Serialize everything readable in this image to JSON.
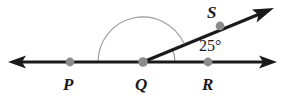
{
  "figure": {
    "labels": {
      "p": "P",
      "q": "Q",
      "r": "R",
      "s": "S",
      "angle_measure": "25°"
    },
    "colors": {
      "line": "#1a1a1a",
      "point_marker": "#8c8c8c",
      "arc": "#9a9a9a",
      "background": "#ffffff",
      "text": "#1a1a1a"
    },
    "geometry": {
      "vertex": "Q",
      "line_PR": "P-Q-R horizontal double-headed arrow",
      "ray_QS": "ray from Q through S, arrowhead up-right",
      "angle_SQR_degrees": 25,
      "angle_PQS_degrees": 155,
      "points": [
        {
          "name": "P",
          "x": 70,
          "y": 62
        },
        {
          "name": "Q",
          "x": 143,
          "y": 62
        },
        {
          "name": "R",
          "x": 208,
          "y": 62
        },
        {
          "name": "S",
          "x": 220,
          "y": 26
        }
      ],
      "arcs": [
        {
          "name": "large-arc-PQS",
          "radius": 45,
          "from_deg": 180,
          "to_deg": 25
        },
        {
          "name": "small-arc-SQR",
          "radius": 32,
          "from_deg": 25,
          "to_deg": 0
        }
      ]
    }
  }
}
